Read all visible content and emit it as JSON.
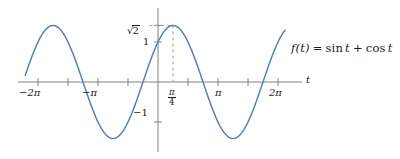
{
  "figure": {
    "title": "",
    "background_color": "#ffffff",
    "curve_color": "#5b7fb4",
    "axis_color": "#808080",
    "text_color": "#1a1a1a",
    "dash_color": "#9a9a9a"
  },
  "labels": {
    "x_axis_name": "t",
    "function_label_lhs": "f(t)",
    "function_label_eq": "=",
    "function_label_rhs_sin": "sin",
    "function_label_var1": "t",
    "function_label_plus": "+",
    "function_label_rhs_cos": "cos",
    "function_label_var2": "t",
    "function_label_full": "f(t) = sin t + cos t",
    "y_sqrt2_radical": "√",
    "y_sqrt2_radicand": "2",
    "y_sqrt2": "√2",
    "y_one": "1",
    "y_neg_one": "−1",
    "x_neg_2pi": "−2π",
    "x_neg_pi": "−π",
    "x_pi": "π",
    "x_2pi": "2π",
    "x_pi_over_4_num": "π",
    "x_pi_over_4_den": "4",
    "x_pi_over_4": "π/4"
  },
  "chart_data": {
    "type": "line",
    "title": "",
    "xlabel": "t",
    "ylabel": "",
    "grid": false,
    "legend": "none",
    "function_expression": "f(t) = sin t + cos t",
    "equivalent_form": "sqrt(2) * sin(t + pi/4)",
    "amplitude": 1.4142,
    "period": 6.2832,
    "phase_shift": 0.7854,
    "xlim": [
      -7.2,
      7.0
    ],
    "ylim": [
      -1.75,
      1.75
    ],
    "x_tick_values": [
      -6.2832,
      -4.7124,
      -3.1416,
      -1.5708,
      1.5708,
      3.1416,
      4.7124,
      6.2832
    ],
    "x_tick_labels": [
      "−2π",
      "",
      "−π",
      "",
      "",
      "π",
      "",
      "2π"
    ],
    "x_special_tick_value": 0.7854,
    "x_special_tick_label": "π/4",
    "y_tick_values": [
      1,
      1.4142,
      -1
    ],
    "y_tick_labels": [
      "1",
      "√2",
      "−1"
    ],
    "annotations": [
      {
        "type": "dashed-vline",
        "x": 0.7854,
        "y_from": 0,
        "y_to": 1.4142,
        "note": "drop line from maximum at t = pi/4 to t-axis"
      },
      {
        "type": "dashed-hline",
        "y": 1.4142,
        "x_from": -0.45,
        "x_to": 0.7854,
        "note": "level line from sqrt(2) tick to the maximum"
      },
      {
        "type": "function-label",
        "text": "f(t) = sin t + cos t",
        "x": 5.1,
        "y": 1.02
      }
    ],
    "key_points": [
      {
        "t": -5.4978,
        "f": 1.4142,
        "kind": "maximum"
      },
      {
        "t": -3.927,
        "f": 0.0,
        "kind": "zero"
      },
      {
        "t": -2.3562,
        "f": -1.4142,
        "kind": "minimum"
      },
      {
        "t": -0.7854,
        "f": 0.0,
        "kind": "zero"
      },
      {
        "t": 0.0,
        "f": 1.0,
        "kind": "y-intercept"
      },
      {
        "t": 0.7854,
        "f": 1.4142,
        "kind": "maximum"
      },
      {
        "t": 2.3562,
        "f": 0.0,
        "kind": "zero"
      },
      {
        "t": 3.927,
        "f": -1.4142,
        "kind": "minimum"
      },
      {
        "t": 5.4978,
        "f": 0.0,
        "kind": "zero"
      }
    ],
    "series": [
      {
        "name": "f(t) = sin t + cos t",
        "color": "#5b7fb4",
        "t_start": -6.95,
        "t_end": 6.65,
        "samples": 273
      }
    ]
  }
}
